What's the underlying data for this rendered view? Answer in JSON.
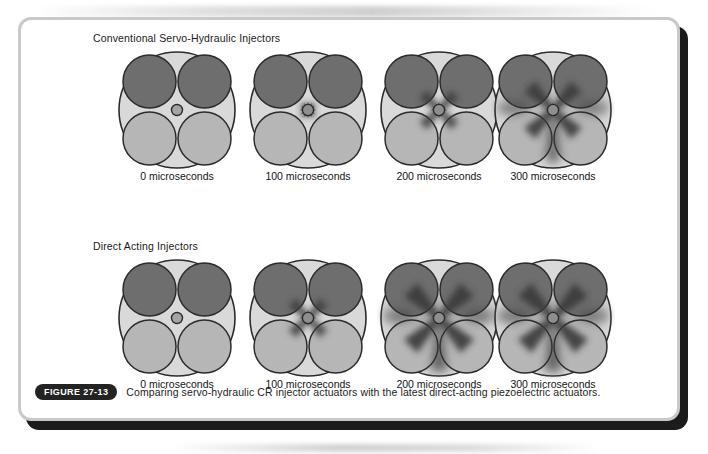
{
  "figure": {
    "badge_label": "FIGURE 27-13",
    "caption": "Comparing servo-hydraulic CR injector actuators with the latest direct-acting piezoelectric actuators."
  },
  "colors": {
    "frame_border": "#c9c9c9",
    "frame_shadow": "#1b1b1b",
    "bore_fill": "#d9d9d9",
    "bore_stroke": "#2b2b2b",
    "upper_valve_fill": "#6e6e6e",
    "lower_valve_fill": "#b6b6b6",
    "valve_stroke": "#2b2b2b",
    "nozzle_fill": "#8e8e8e",
    "spray_dark": "#3a3a3a",
    "text": "#1a1a1a",
    "badge_bg": "#232323",
    "badge_text": "#ffffff"
  },
  "panels": [
    {
      "id": "conventional",
      "heading": "Conventional Servo-Hydraulic Injectors",
      "stages": [
        {
          "time_label": "0 microseconds",
          "time_us": 0,
          "spray_level": 0
        },
        {
          "time_label": "100 microseconds",
          "time_us": 100,
          "spray_level": 1
        },
        {
          "time_label": "200 microseconds",
          "time_us": 200,
          "spray_level": 2
        },
        {
          "time_label": "300 microseconds",
          "time_us": 300,
          "spray_level": 3
        }
      ]
    },
    {
      "id": "direct",
      "heading": "Direct Acting Injectors",
      "stages": [
        {
          "time_label": "0 microseconds",
          "time_us": 0,
          "spray_level": 0
        },
        {
          "time_label": "100 microseconds",
          "time_us": 100,
          "spray_level": 2
        },
        {
          "time_label": "200 microseconds",
          "time_us": 200,
          "spray_level": 4
        },
        {
          "time_label": "300 microseconds",
          "time_us": 300,
          "spray_level": 4
        }
      ]
    }
  ]
}
